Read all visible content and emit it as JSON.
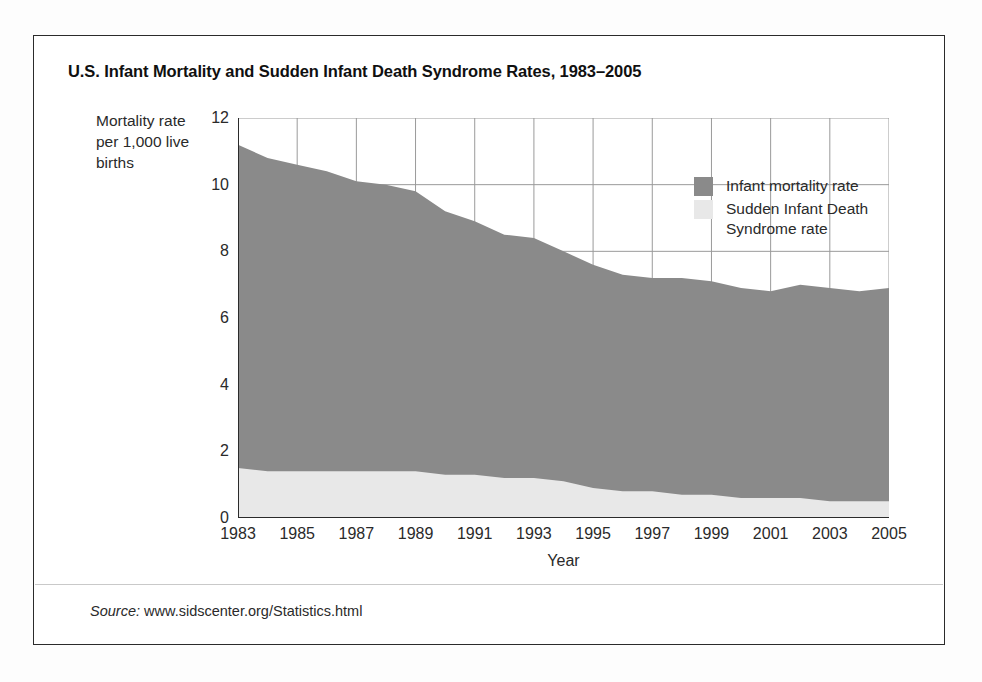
{
  "figure": {
    "title": "U.S. Infant Mortality and Sudden Infant Death Syndrome Rates, 1983–2005",
    "source_label": "Source:",
    "source_value": "www.sidscenter.org/Statistics.html"
  },
  "axes": {
    "y_title": "Mortality rate per 1,000 live births",
    "x_title": "Year",
    "y_ticks": [
      "0",
      "2",
      "4",
      "6",
      "8",
      "10",
      "12"
    ],
    "x_ticks": [
      "1983",
      "1985",
      "1987",
      "1989",
      "1991",
      "1993",
      "1995",
      "1997",
      "1999",
      "2001",
      "2003",
      "2005"
    ]
  },
  "legend": {
    "position": "inside-top-right",
    "items": [
      {
        "label": "Infant mortality rate",
        "color": "#8a8a8a"
      },
      {
        "label": "Sudden Infant Death\nSyndrome rate",
        "color": "#e8e8e8"
      }
    ]
  },
  "colors": {
    "infant_mortality_fill": "#8a8a8a",
    "sids_fill": "#e8e8e8",
    "grid": "#9a9a9a",
    "axis": "#2b2b2b",
    "frame": "#2b2b2b",
    "plot_background": "#ffffff"
  },
  "chart_data": {
    "type": "area",
    "stacked": false,
    "title": "U.S. Infant Mortality and Sudden Infant Death Syndrome Rates, 1983–2005",
    "xlabel": "Year",
    "ylabel": "Mortality rate per 1,000 live births",
    "xlim": [
      1983,
      2005
    ],
    "ylim": [
      0,
      12
    ],
    "ytick_step": 2,
    "xtick_step": 2,
    "grid": true,
    "x": [
      1983,
      1984,
      1985,
      1986,
      1987,
      1988,
      1989,
      1990,
      1991,
      1992,
      1993,
      1994,
      1995,
      1996,
      1997,
      1998,
      1999,
      2000,
      2001,
      2002,
      2003,
      2004,
      2005
    ],
    "series": [
      {
        "name": "Infant mortality rate",
        "color": "#8a8a8a",
        "values": [
          11.2,
          10.8,
          10.6,
          10.4,
          10.1,
          10.0,
          9.8,
          9.2,
          8.9,
          8.5,
          8.4,
          8.0,
          7.6,
          7.3,
          7.2,
          7.2,
          7.1,
          6.9,
          6.8,
          7.0,
          6.9,
          6.8,
          6.9
        ]
      },
      {
        "name": "Sudden Infant Death Syndrome rate",
        "color": "#e8e8e8",
        "values": [
          1.5,
          1.4,
          1.4,
          1.4,
          1.4,
          1.4,
          1.4,
          1.3,
          1.3,
          1.2,
          1.2,
          1.1,
          0.9,
          0.8,
          0.8,
          0.7,
          0.7,
          0.6,
          0.6,
          0.6,
          0.5,
          0.5,
          0.5
        ]
      }
    ]
  }
}
